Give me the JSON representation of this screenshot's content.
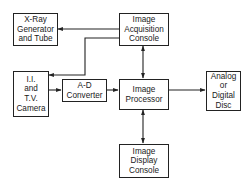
{
  "diagram": {
    "type": "block-diagram",
    "nodes": [
      {
        "id": "xray",
        "lines": [
          "X-Ray",
          "Generator",
          "and Tube"
        ]
      },
      {
        "id": "acquisition",
        "lines": [
          "Image",
          "Acquisition",
          "Console"
        ]
      },
      {
        "id": "camera",
        "lines": [
          "I.I.",
          "and",
          "T.V.",
          "Camera"
        ]
      },
      {
        "id": "adc",
        "lines": [
          "A-D",
          "Converter"
        ]
      },
      {
        "id": "processor",
        "lines": [
          "Image",
          "Processor"
        ]
      },
      {
        "id": "disc",
        "lines": [
          "Analog",
          "or",
          "Digital",
          "Disc"
        ]
      },
      {
        "id": "display",
        "lines": [
          "Image",
          "Display",
          "Console"
        ]
      }
    ],
    "edges": [
      {
        "from": "acquisition",
        "to": "xray",
        "direction": "one-way"
      },
      {
        "from": "acquisition",
        "to": "camera",
        "direction": "one-way"
      },
      {
        "from": "camera",
        "to": "adc",
        "direction": "one-way"
      },
      {
        "from": "adc",
        "to": "processor",
        "direction": "one-way"
      },
      {
        "from": "acquisition",
        "to": "processor",
        "direction": "two-way"
      },
      {
        "from": "processor",
        "to": "disc",
        "direction": "one-way"
      },
      {
        "from": "processor",
        "to": "display",
        "direction": "two-way"
      }
    ]
  }
}
